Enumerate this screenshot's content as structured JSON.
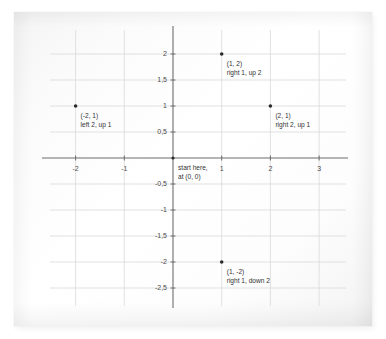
{
  "chart_data": {
    "type": "scatter",
    "title": "",
    "xlabel": "",
    "ylabel": "",
    "xlim": [
      -2.55,
      3.55
    ],
    "ylim": [
      -2.75,
      2.35
    ],
    "grid": true,
    "legend_position": "none",
    "x_ticks": [
      -2,
      -1,
      1,
      2,
      3
    ],
    "x_tick_labels": [
      "-2",
      "-1",
      "1",
      "2",
      "3"
    ],
    "y_ticks": [
      2,
      1.5,
      1,
      0.5,
      -0.5,
      -1,
      -1.5,
      -2,
      -2.5
    ],
    "y_tick_labels": [
      "2",
      "1,5",
      "1",
      "0,5",
      "-0,5",
      "-1",
      "-1,5",
      "-2",
      "-2,5"
    ],
    "points": [
      {
        "x": 1,
        "y": 2,
        "coord_label": "(1, 2)",
        "move_label": "right 1, up 2",
        "label_align": "left"
      },
      {
        "x": -2,
        "y": 1,
        "coord_label": "(-2, 1)",
        "move_label": "left 2, up 1",
        "label_align": "left"
      },
      {
        "x": 2,
        "y": 1,
        "coord_label": "(2, 1)",
        "move_label": "right 2, up 1",
        "label_align": "left"
      },
      {
        "x": 1,
        "y": -2,
        "coord_label": "(1, -2)",
        "move_label": "right 1, down 2",
        "label_align": "left"
      }
    ],
    "origin_annotation": {
      "x": 0,
      "y": 0,
      "line1": "start here,",
      "line2": "at (0, 0)"
    },
    "colors": {
      "point": "#2b2b2b",
      "axis": "#6d6d6d",
      "grid": "#d9d9d9",
      "text": "#333333",
      "paper": "#fbfbfb",
      "background": "#ffffff"
    }
  }
}
